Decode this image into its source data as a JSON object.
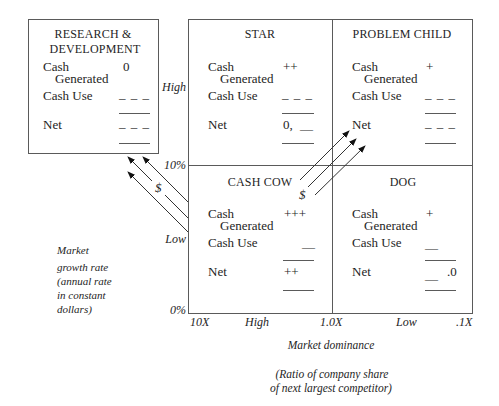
{
  "rd_box": {
    "title_line1": "RESEARCH &",
    "title_line2": "DEVELOPMENT",
    "cash_generated_label_1": "Cash",
    "cash_generated_label_2": "Generated",
    "cash_generated_value": "0",
    "cash_use_label": "Cash Use",
    "cash_use_value": "– – –",
    "net_label": "Net",
    "net_value": "– – –"
  },
  "quadrants": {
    "star": {
      "title": "STAR",
      "cash_generated_label_1": "Cash",
      "cash_generated_label_2": "Generated",
      "cash_generated_value": "++",
      "cash_use_label": "Cash Use",
      "cash_use_value": "– – –",
      "net_label": "Net",
      "net_value": "0,",
      "net_value_2": "—"
    },
    "problem_child": {
      "title": "PROBLEM CHILD",
      "cash_generated_label_1": "Cash",
      "cash_generated_label_2": "Generated",
      "cash_generated_value": "+",
      "cash_use_label": "Cash Use",
      "cash_use_value": "– – –",
      "net_label": "Net",
      "net_value": "– – –"
    },
    "cash_cow": {
      "title": "CASH COW",
      "cash_generated_label_1": "Cash",
      "cash_generated_label_2": "Generated",
      "cash_generated_value": "+++",
      "cash_use_label": "Cash Use",
      "cash_use_value": "—",
      "net_label": "Net",
      "net_value": "++"
    },
    "dog": {
      "title": "DOG",
      "cash_generated_label_1": "Cash",
      "cash_generated_label_2": "Generated",
      "cash_generated_value": "+",
      "cash_use_label": "Cash Use",
      "cash_use_value": "—",
      "net_label": "Net",
      "net_value": "—",
      "net_value_2": ".0"
    }
  },
  "y_axis": {
    "ticks": [
      "High",
      "10%",
      "Low",
      "0%"
    ],
    "label_lines": [
      "Market",
      "growth rate",
      "(annual rate",
      "in constant",
      "dollars)"
    ]
  },
  "x_axis": {
    "ticks": [
      "10X",
      "High",
      "1.0X",
      "Low",
      ".1X"
    ],
    "label": "Market dominance",
    "sublabel_lines": [
      "(Ratio of company share",
      "of next largest competitor)"
    ]
  },
  "flows": {
    "to_rd_symbol": "$",
    "to_problem_child_symbol": "$"
  },
  "colors": {
    "line": "#5a5a5a",
    "text": "#1e1e1e",
    "background": "#ffffff"
  }
}
